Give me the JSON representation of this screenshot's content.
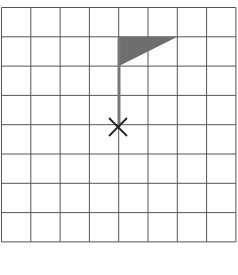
{
  "diagram": {
    "grid": {
      "columns": 8,
      "rows": 8,
      "left": 1.5,
      "top": 7.5,
      "cell": 29.3,
      "line_color": "#555555"
    },
    "flag": {
      "pole": {
        "x": 119,
        "y1": 37,
        "y2": 127,
        "color": "#777777"
      },
      "triangle": {
        "points": "119,37 177,37 119,66",
        "color": "#6e6e6e"
      }
    },
    "marker": {
      "type": "x-mark",
      "cx": 118,
      "cy": 127,
      "size": 9,
      "color": "#222222"
    }
  }
}
